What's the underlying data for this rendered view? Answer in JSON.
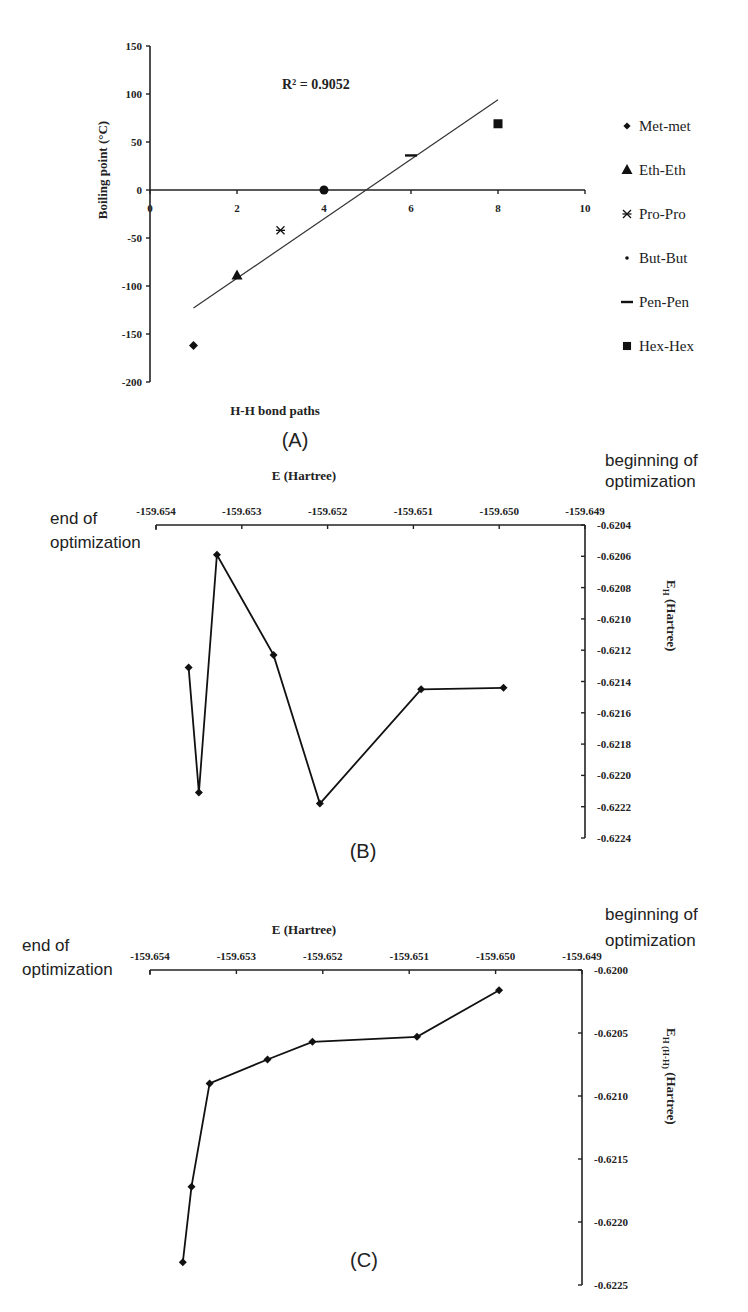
{
  "chart_data": [
    {
      "panel": "(A)",
      "type": "scatter",
      "title": "",
      "xlabel": "H-H bond paths",
      "ylabel": "Boiling point (°C)",
      "xlim": [
        0,
        10
      ],
      "ylim": [
        -200,
        150
      ],
      "x_ticks": [
        "0",
        "2",
        "4",
        "6",
        "8",
        "10"
      ],
      "y_ticks": [
        "150",
        "100",
        "50",
        "0",
        "-50",
        "-100",
        "-150",
        "-200"
      ],
      "grid": false,
      "legend_position": "right",
      "annotation": "R² = 0.9052",
      "trendline": {
        "type": "linear",
        "from": [
          1,
          -123
        ],
        "to": [
          8,
          94
        ]
      },
      "series": [
        {
          "name": "Met-met",
          "marker": "diamond",
          "x": [
            1
          ],
          "y": [
            -162
          ]
        },
        {
          "name": "Eth-Eth",
          "marker": "triangle",
          "x": [
            2
          ],
          "y": [
            -89
          ]
        },
        {
          "name": "Pro-Pro",
          "marker": "asterisk",
          "x": [
            3
          ],
          "y": [
            -42
          ]
        },
        {
          "name": "But-But",
          "marker": "circle",
          "x": [
            4
          ],
          "y": [
            0
          ]
        },
        {
          "name": "Pen-Pen",
          "marker": "dash",
          "x": [
            6
          ],
          "y": [
            36
          ]
        },
        {
          "name": "Hex-Hex",
          "marker": "square",
          "x": [
            8
          ],
          "y": [
            69
          ]
        }
      ]
    },
    {
      "panel": "(B)",
      "type": "line",
      "xlabel": "E (Hartree)",
      "ylabel": "E_H (Hartree)",
      "ylabel_main": "E",
      "ylabel_sub": "H",
      "ylabel_unit": "(Hartree)",
      "xlim": [
        -159.654,
        -159.649
      ],
      "ylim": [
        -0.6224,
        -0.6204
      ],
      "x_ticks": [
        "-159.654",
        "-159.653",
        "-159.652",
        "-159.651",
        "-159.650",
        "-159.649"
      ],
      "y_ticks": [
        "-0.6204",
        "-0.6206",
        "-0.6208",
        "-0.6210",
        "-0.6212",
        "-0.6214",
        "-0.6216",
        "-0.6218",
        "-0.6220",
        "-0.6222",
        "-0.6224"
      ],
      "annotations": [
        "end of optimization",
        "beginning of optimization"
      ],
      "series": [
        {
          "name": "E_H",
          "marker": "diamond",
          "x": [
            -159.65362,
            -159.6535,
            -159.65329,
            -159.65263,
            -159.65209,
            -159.65091,
            -159.64995
          ],
          "y": [
            -0.62131,
            -0.62211,
            -0.62059,
            -0.62123,
            -0.62218,
            -0.62145,
            -0.62144
          ]
        }
      ]
    },
    {
      "panel": "(C)",
      "type": "line",
      "xlabel": "E (Hartree)",
      "ylabel": "E_H (H-H) (Hartree)",
      "ylabel_main": "E",
      "ylabel_sub": "H (H-H)",
      "ylabel_unit": "(Hartree)",
      "xlim": [
        -159.654,
        -159.649
      ],
      "ylim": [
        -0.6225,
        -0.62
      ],
      "x_ticks": [
        "-159.654",
        "-159.653",
        "-159.652",
        "-159.651",
        "-159.650",
        "-159.649"
      ],
      "y_ticks": [
        "-0.6200",
        "-0.6205",
        "-0.6210",
        "-0.6215",
        "-0.6220",
        "-0.6225"
      ],
      "annotations": [
        "end of optimization",
        "beginning of optimization"
      ],
      "series": [
        {
          "name": "E_H(H-H)",
          "marker": "diamond",
          "x": [
            -159.65362,
            -159.65352,
            -159.65331,
            -159.65264,
            -159.65212,
            -159.65091,
            -159.64996
          ],
          "y": [
            -0.62232,
            -0.62172,
            -0.6209,
            -0.62071,
            -0.62057,
            -0.62053,
            -0.62016
          ]
        }
      ]
    }
  ],
  "labels": {
    "panel_a": "(A)",
    "panel_b": "(B)",
    "panel_c": "(C)",
    "end_line1": "end of",
    "end_line2": "optimization",
    "begin_line1": "beginning of",
    "begin_line2": "optimization"
  }
}
